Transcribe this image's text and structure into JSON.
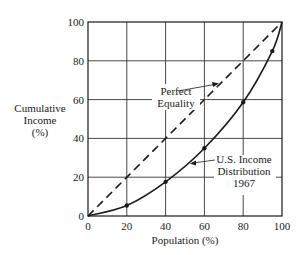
{
  "chart_data": {
    "type": "line",
    "title": "",
    "xlabel": "Population (%)",
    "ylabel": [
      "Cumulative",
      "Income",
      "(%)"
    ],
    "xlim": [
      0,
      100
    ],
    "ylim": [
      0,
      100
    ],
    "grid": true,
    "x_ticks": [
      "0",
      "20",
      "40",
      "60",
      "80",
      "100"
    ],
    "y_ticks": [
      "0",
      "20",
      "40",
      "60",
      "80",
      "100"
    ],
    "series": [
      {
        "name": "Perfect Equality",
        "style": "dashed",
        "x": [
          0,
          100
        ],
        "y": [
          0,
          100
        ]
      },
      {
        "name": "U.S. Income Distribution 1967",
        "style": "solid",
        "x": [
          0,
          20,
          40,
          60,
          80,
          95,
          100
        ],
        "y": [
          0,
          5.4,
          17.6,
          34.9,
          58.6,
          85,
          100
        ],
        "markers": [
          20,
          40,
          60,
          80,
          95
        ]
      }
    ],
    "annotations": [
      {
        "text": [
          "Perfect",
          "Equality"
        ],
        "target_series": "Perfect Equality"
      },
      {
        "text": [
          "U.S. Income",
          "Distribution",
          "1967"
        ],
        "target_series": "U.S. Income Distribution 1967"
      }
    ],
    "legend": "none (inline annotations with arrows)"
  },
  "labels": {
    "x_axis": "Population (%)",
    "y_axis_line1": "Cumulative",
    "y_axis_line2": "Income",
    "y_axis_line3": "(%)",
    "equality_line1": "Perfect",
    "equality_line2": "Equality",
    "lorenz_line1": "U.S. Income",
    "lorenz_line2": "Distribution",
    "lorenz_line3": "1967"
  },
  "colors": {
    "ink": "#1a1a1a",
    "grid": "#333333",
    "background": "#ffffff"
  }
}
